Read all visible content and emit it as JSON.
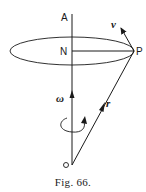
{
  "figure": {
    "caption": "Fig. 66.",
    "labels": {
      "axis_top": "A",
      "center": "N",
      "point": "P",
      "velocity": "v",
      "angular_velocity": "ω",
      "position": "r",
      "origin": "O"
    },
    "colors": {
      "ink": "#1a1a1a",
      "background": "#ffffff"
    }
  }
}
